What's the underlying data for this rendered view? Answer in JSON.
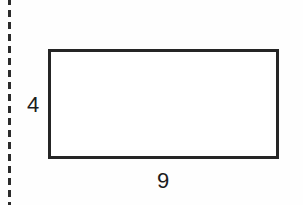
{
  "figure": {
    "name": "rectangle-with-dimensions",
    "shape_type": "rectangle",
    "background_color": "#fefefe",
    "stroke_color": "#252525",
    "fill_color": "#ffffff",
    "labels": {
      "height": "4",
      "width": "9"
    },
    "cut_line": {
      "orientation": "vertical",
      "style": "dashed",
      "color": "#2b2b2b"
    }
  },
  "chart_data": {
    "type": "diagram",
    "title": "",
    "shape": "rectangle",
    "dimensions": {
      "height": 4,
      "width": 9
    },
    "annotations": [
      {
        "text": "4",
        "position": "left",
        "refers_to": "height"
      },
      {
        "text": "9",
        "position": "bottom",
        "refers_to": "width"
      }
    ]
  }
}
